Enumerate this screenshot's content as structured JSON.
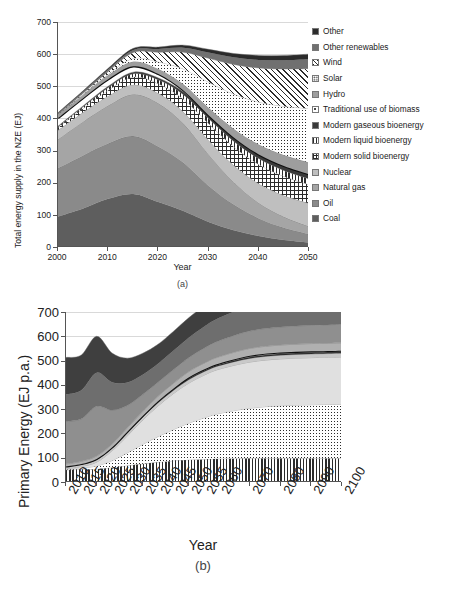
{
  "figure": {
    "panel_a_caption": "(a)",
    "panel_b_caption": "(b)"
  },
  "chart_data": [
    {
      "id": "a",
      "type": "area",
      "title": "",
      "xlabel": "Year",
      "ylabel": "Total energy supply in the NZE (EJ)",
      "xlim": [
        2000,
        2050
      ],
      "ylim": [
        0,
        700
      ],
      "yticks": [
        0,
        100,
        200,
        300,
        400,
        500,
        600,
        700
      ],
      "xticks": [
        2000,
        2010,
        2020,
        2030,
        2040,
        2050
      ],
      "grid": true,
      "legend_position": "right",
      "stacked": true,
      "x": [
        2000,
        2005,
        2010,
        2015,
        2020,
        2025,
        2030,
        2035,
        2040,
        2045,
        2050
      ],
      "series": [
        {
          "name": "Coal",
          "fill": "solid",
          "color": "#5e5e5e",
          "values": [
            95,
            120,
            150,
            165,
            140,
            112,
            78,
            52,
            34,
            22,
            14
          ]
        },
        {
          "name": "Oil",
          "fill": "solid",
          "color": "#8a8a8a",
          "values": [
            150,
            165,
            172,
            180,
            172,
            150,
            112,
            80,
            55,
            38,
            26
          ]
        },
        {
          "name": "Natural gas",
          "fill": "solid",
          "color": "#a5a5a5",
          "values": [
            90,
            105,
            118,
            130,
            135,
            122,
            98,
            70,
            48,
            34,
            24
          ]
        },
        {
          "name": "Nuclear",
          "fill": "solid",
          "color": "#bfbfbf",
          "values": [
            28,
            29,
            30,
            30,
            31,
            36,
            44,
            52,
            60,
            66,
            72
          ]
        },
        {
          "name": "Modern solid bioenergy",
          "fill": "crosshatch",
          "color": "#ffffff",
          "values": [
            8,
            12,
            18,
            24,
            30,
            40,
            52,
            58,
            60,
            60,
            58
          ]
        },
        {
          "name": "Modern liquid bioenergy",
          "fill": "vertical",
          "color": "#ffffff",
          "values": [
            3,
            5,
            8,
            10,
            12,
            14,
            16,
            17,
            18,
            18,
            18
          ]
        },
        {
          "name": "Modern gaseous bioenergy",
          "fill": "solid",
          "color": "#3a3a3a",
          "values": [
            2,
            3,
            4,
            5,
            6,
            8,
            10,
            12,
            13,
            14,
            14
          ]
        },
        {
          "name": "Traditional use of biomass",
          "fill": "line",
          "color": "#111111",
          "values": [
            25,
            24,
            22,
            18,
            12,
            5,
            0,
            0,
            0,
            0,
            0
          ]
        },
        {
          "name": "Hydro",
          "fill": "solid",
          "color": "#9e9e9e",
          "values": [
            10,
            11,
            13,
            15,
            16,
            19,
            23,
            27,
            31,
            34,
            37
          ]
        },
        {
          "name": "Solar",
          "fill": "dots",
          "color": "#ffffff",
          "values": [
            0,
            1,
            3,
            10,
            22,
            48,
            80,
            108,
            132,
            152,
            168
          ]
        },
        {
          "name": "Wind",
          "fill": "diagonal",
          "color": "#ffffff",
          "values": [
            1,
            3,
            8,
            18,
            30,
            52,
            74,
            92,
            106,
            116,
            124
          ]
        },
        {
          "name": "Other renewables",
          "fill": "solid",
          "color": "#707070",
          "values": [
            4,
            5,
            6,
            8,
            10,
            14,
            18,
            22,
            25,
            27,
            29
          ]
        },
        {
          "name": "Other",
          "fill": "solid",
          "color": "#2b2b2b",
          "values": [
            2,
            3,
            4,
            5,
            6,
            8,
            10,
            12,
            14,
            15,
            16
          ]
        }
      ],
      "legend_items": [
        {
          "label": "Other",
          "swatch": "solid",
          "color": "#2b2b2b"
        },
        {
          "label": "Other renewables",
          "swatch": "solid",
          "color": "#707070"
        },
        {
          "label": "Wind",
          "swatch": "diagonal",
          "color": "#ffffff"
        },
        {
          "label": "Solar",
          "swatch": "dots",
          "color": "#ffffff"
        },
        {
          "label": "Hydro",
          "swatch": "solid",
          "color": "#9e9e9e"
        },
        {
          "label": "Traditional use of biomass",
          "swatch": "speck",
          "color": "#ffffff"
        },
        {
          "label": "Modern gaseous bioenergy",
          "swatch": "solid",
          "color": "#3a3a3a"
        },
        {
          "label": "Modern liquid bioenergy",
          "swatch": "vertical",
          "color": "#ffffff"
        },
        {
          "label": "Modern solid bioenergy",
          "swatch": "crosshatch",
          "color": "#ffffff"
        },
        {
          "label": "Nuclear",
          "swatch": "solid",
          "color": "#bfbfbf"
        },
        {
          "label": "Natural gas",
          "swatch": "solid",
          "color": "#a5a5a5"
        },
        {
          "label": "Oil",
          "swatch": "solid",
          "color": "#8a8a8a"
        },
        {
          "label": "Coal",
          "swatch": "solid",
          "color": "#5e5e5e"
        }
      ]
    },
    {
      "id": "b",
      "type": "area",
      "title": "",
      "xlabel": "Year",
      "ylabel": "Primary Energy (EJ p.a.)",
      "xlim": [
        2010,
        2100
      ],
      "ylim": [
        0,
        700
      ],
      "yticks": [
        0,
        100,
        200,
        300,
        400,
        500,
        600,
        700
      ],
      "xticks": [
        2010,
        2015,
        2020,
        2025,
        2030,
        2035,
        2040,
        2045,
        2050,
        2055,
        2060,
        2070,
        2080,
        2090,
        2100
      ],
      "grid": true,
      "legend_position": "right",
      "stacked": true,
      "x": [
        2010,
        2015,
        2020,
        2025,
        2030,
        2035,
        2040,
        2045,
        2050,
        2055,
        2060,
        2070,
        2080,
        2090,
        2100
      ],
      "series": [
        {
          "name": "Biomass",
          "fill": "vertical",
          "color": "#ffffff",
          "values": [
            50,
            52,
            54,
            60,
            68,
            75,
            82,
            88,
            92,
            94,
            96,
            98,
            98,
            98,
            98
          ]
        },
        {
          "name": "Wind",
          "fill": "dots",
          "color": "#ffffff",
          "values": [
            3,
            6,
            12,
            28,
            52,
            80,
            105,
            128,
            150,
            170,
            186,
            206,
            216,
            220,
            222
          ]
        },
        {
          "name": "Solar",
          "fill": "solid",
          "color": "#e0e0e0",
          "values": [
            2,
            6,
            16,
            40,
            70,
            100,
            126,
            148,
            165,
            176,
            183,
            190,
            193,
            194,
            195
          ]
        },
        {
          "name": "Hydro",
          "fill": "solid",
          "color": "#c9c9c9",
          "values": [
            8,
            9,
            10,
            11,
            12,
            12,
            13,
            13,
            14,
            14,
            14,
            15,
            15,
            15,
            15
          ]
        },
        {
          "name": "Geothermal",
          "fill": "solid",
          "color": "#2b2b2b",
          "values": [
            1,
            1,
            2,
            2,
            3,
            3,
            4,
            4,
            5,
            5,
            5,
            6,
            6,
            6,
            6
          ]
        },
        {
          "name": "Tidal",
          "fill": "line",
          "color": "#111111",
          "values": [
            0,
            0,
            1,
            1,
            2,
            2,
            3,
            3,
            4,
            4,
            4,
            5,
            5,
            5,
            5
          ]
        },
        {
          "name": "Nuclear",
          "fill": "solid",
          "color": "#b0b0b0",
          "values": [
            10,
            11,
            12,
            14,
            16,
            18,
            20,
            22,
            24,
            26,
            28,
            30,
            31,
            32,
            32
          ]
        },
        {
          "name": "Oil",
          "fill": "solid",
          "color": "#8f8f8f",
          "values": [
            175,
            175,
            205,
            140,
            92,
            70,
            58,
            56,
            58,
            62,
            66,
            72,
            74,
            75,
            76
          ]
        },
        {
          "name": "Gas",
          "fill": "solid",
          "color": "#6e6e6e",
          "values": [
            112,
            118,
            138,
            115,
            95,
            82,
            76,
            78,
            82,
            88,
            94,
            102,
            108,
            110,
            112
          ]
        },
        {
          "name": "Coal",
          "fill": "solid",
          "color": "#3f3f3f",
          "values": [
            152,
            145,
            150,
            120,
            100,
            88,
            80,
            80,
            82,
            85,
            88,
            92,
            96,
            98,
            100
          ]
        }
      ],
      "legend_items": [
        {
          "label": "Coal",
          "swatch": "solid",
          "color": "#3f3f3f"
        },
        {
          "label": "Gas",
          "swatch": "solid",
          "color": "#6e6e6e"
        },
        {
          "label": "Oil",
          "swatch": "solid",
          "color": "#8f8f8f"
        },
        {
          "label": "Nuclear",
          "swatch": "solid",
          "color": "#b0b0b0"
        },
        {
          "label": "Tidal",
          "swatch": "line",
          "color": "#111111"
        },
        {
          "label": "Geothermal",
          "swatch": "solid",
          "color": "#2b2b2b"
        },
        {
          "label": "Hydro",
          "swatch": "solid",
          "color": "#c9c9c9"
        },
        {
          "label": "Solar",
          "swatch": "solid",
          "color": "#e0e0e0"
        },
        {
          "label": "Wind",
          "swatch": "dots",
          "color": "#ffffff"
        },
        {
          "label": "Biomass",
          "swatch": "vertical",
          "color": "#ffffff"
        }
      ]
    }
  ]
}
